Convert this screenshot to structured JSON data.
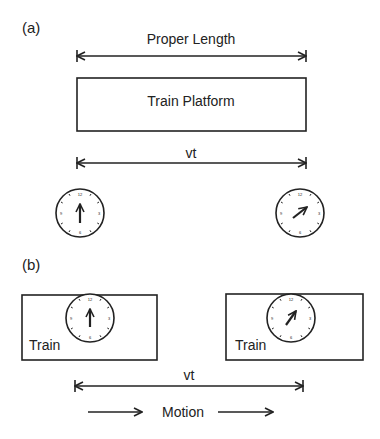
{
  "panel_a": {
    "label": "(a)",
    "proper_length_label": "Proper Length",
    "platform_label": "Train Platform",
    "distance_label": "vt",
    "clock_left": {
      "hand": "12 o'clock (up)"
    },
    "clock_right": {
      "hand": "about 2 o'clock"
    }
  },
  "panel_b": {
    "label": "(b)",
    "train_left_label": "Train",
    "train_right_label": "Train",
    "distance_label": "vt",
    "motion_label": "Motion"
  },
  "colors": {
    "stroke": "#222222",
    "background": "#ffffff"
  }
}
